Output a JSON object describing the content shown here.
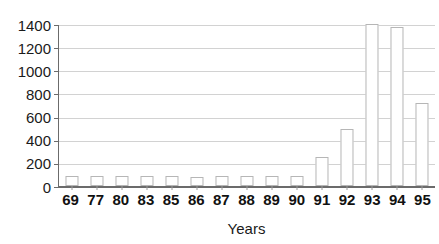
{
  "chart_data": {
    "type": "bar",
    "title": "",
    "subtitle": "",
    "xlabel": "Years",
    "ylabel": "",
    "categories": [
      "69",
      "77",
      "80",
      "83",
      "85",
      "86",
      "87",
      "88",
      "89",
      "90",
      "91",
      "92",
      "93",
      "94",
      "95"
    ],
    "values": [
      88,
      88,
      88,
      88,
      88,
      78,
      90,
      88,
      88,
      88,
      250,
      490,
      1420,
      1370,
      720
    ],
    "ylim": [
      0,
      1400
    ],
    "ytick_values": [
      0,
      200,
      400,
      600,
      800,
      1000,
      1200,
      1400
    ],
    "ytick_labels": [
      "0",
      "200",
      "400",
      "600",
      "800",
      "1000",
      "1200",
      "1400"
    ],
    "grid": "horizontal",
    "legend": "none",
    "annotations": [],
    "colors": {
      "bar_fill": "#ffffff",
      "bar_stroke": "#b6b6b6",
      "gridline": "#d2d2d2",
      "axis": "#6b6b6b",
      "tick_label": "#111111",
      "axis_title": "#1a1a1a",
      "background": "#ffffff"
    }
  }
}
